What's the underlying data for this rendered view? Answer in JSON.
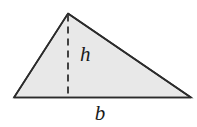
{
  "figure": {
    "name": "triangle-area-diagram",
    "background_color": "#ffffff",
    "fill_color": "#e8e8e8",
    "stroke_color": "#2b2b2b",
    "dash_color": "#3a3a3a",
    "label_color": "#1a1a1a",
    "stroke_width": 1.6,
    "dash_width": 1.8,
    "dash_pattern": "7 5",
    "vertices": {
      "apex": {
        "x": 68,
        "y": 13.5
      },
      "bottom_left": {
        "x": 14,
        "y": 97.5
      },
      "bottom_right": {
        "x": 191,
        "y": 97.5
      }
    },
    "height_line": {
      "x": 68,
      "y_top": 13.5,
      "y_bottom": 97.5
    },
    "labels": [
      {
        "id": "height-label",
        "text": "h",
        "x": 80,
        "y": 61,
        "font_size": 21
      },
      {
        "id": "base-label",
        "text": "b",
        "x": 100,
        "y": 120,
        "font_size": 21
      }
    ]
  }
}
